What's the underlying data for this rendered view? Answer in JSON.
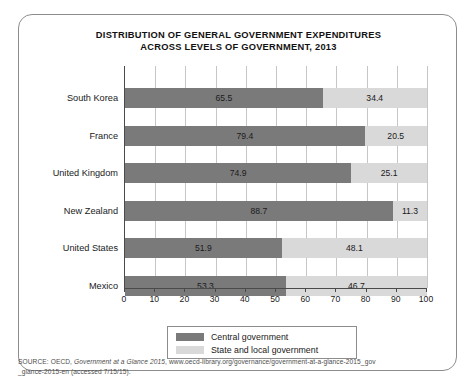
{
  "figure": {
    "title_line1": "DISTRIBUTION OF GENERAL GOVERNMENT EXPENDITURES",
    "title_line2": "ACROSS LEVELS OF GOVERNMENT, 2013"
  },
  "source": {
    "prefix": "SOURCE: OECD, ",
    "italic_title": "Government at a Glance 2015",
    "rest": ", www.oecd-library.org/governance/government-at-a-glance-2015_gov",
    "line2": "_glance-2015-en (accessed 7/15/15)."
  },
  "legend": {
    "items": [
      {
        "label": "Central government",
        "color": "#7a7a7a",
        "key": "central"
      },
      {
        "label": "State and local government",
        "color": "#d9d9d9",
        "key": "local"
      }
    ]
  },
  "chart_data": {
    "type": "bar",
    "orientation": "horizontal",
    "stacked": true,
    "title": "DISTRIBUTION OF GENERAL GOVERNMENT EXPENDITURES ACROSS LEVELS OF GOVERNMENT, 2013",
    "xlabel": "",
    "ylabel": "",
    "xlim": [
      0,
      100
    ],
    "xticks": [
      0,
      10,
      20,
      30,
      40,
      50,
      60,
      70,
      80,
      90,
      100
    ],
    "xtick_labels": [
      "0",
      "10",
      "20",
      "30",
      "40",
      "50",
      "60",
      "70",
      "80",
      "90",
      "100"
    ],
    "grid": "vertical",
    "legend_position": "bottom-center",
    "categories": [
      "South Korea",
      "France",
      "United Kingdom",
      "New Zealand",
      "United States",
      "Mexico"
    ],
    "series": [
      {
        "name": "Central government",
        "color": "#7a7a7a",
        "values": [
          65.5,
          79.4,
          74.9,
          88.7,
          51.9,
          53.3
        ]
      },
      {
        "name": "State and local government",
        "color": "#d9d9d9",
        "values": [
          34.4,
          20.5,
          25.1,
          11.3,
          48.1,
          46.7
        ]
      }
    ],
    "value_labels": [
      {
        "category": "South Korea",
        "central": "65.5",
        "local": "34.4"
      },
      {
        "category": "France",
        "central": "79.4",
        "local": "20.5"
      },
      {
        "category": "United Kingdom",
        "central": "74.9",
        "local": "25.1"
      },
      {
        "category": "New Zealand",
        "central": "88.7",
        "local": "11.3"
      },
      {
        "category": "United States",
        "central": "51.9",
        "local": "48.1"
      },
      {
        "category": "Mexico",
        "central": "53.3",
        "local": "46.7"
      }
    ]
  }
}
